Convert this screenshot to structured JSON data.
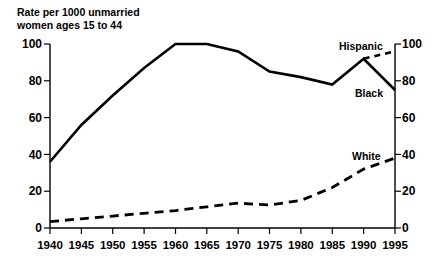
{
  "chart_data": {
    "type": "line",
    "title": "Rate per 1000 unmarried women ages 15 to 44",
    "title_lines": [
      "Rate per 1000 unmarried",
      "women ages 15 to 44"
    ],
    "xlabel": "",
    "ylabel": "",
    "x": [
      1940,
      1945,
      1950,
      1955,
      1960,
      1965,
      1970,
      1975,
      1980,
      1985,
      1990,
      1995
    ],
    "xtick_labels": [
      "1940",
      "1945",
      "1950",
      "1955",
      "1960",
      "1965",
      "1970",
      "1975",
      "1980",
      "1985",
      "1990",
      "1995"
    ],
    "xlim": [
      1940,
      1995
    ],
    "ylim": [
      0,
      100
    ],
    "yticks": [
      0,
      20,
      40,
      60,
      80,
      100
    ],
    "ytick_labels": [
      "0",
      "20",
      "40",
      "60",
      "80",
      "100"
    ],
    "ytick_labels_right": [
      "0",
      "20",
      "40",
      "60",
      "80",
      "100"
    ],
    "grid": false,
    "legend_position": "inline-annotations",
    "series": [
      {
        "name": "Black",
        "style": "solid",
        "color": "#000000",
        "x": [
          1940,
          1945,
          1950,
          1955,
          1960,
          1965,
          1970,
          1975,
          1980,
          1985,
          1990,
          1995
        ],
        "values": [
          36,
          56,
          72,
          87,
          100,
          100,
          96,
          85,
          82,
          78,
          92,
          75
        ]
      },
      {
        "name": "Hispanic",
        "style": "dashed",
        "color": "#000000",
        "x": [
          1990,
          1995
        ],
        "values": [
          92,
          96
        ]
      },
      {
        "name": "White",
        "style": "dashed",
        "color": "#000000",
        "x": [
          1940,
          1945,
          1950,
          1955,
          1960,
          1965,
          1970,
          1975,
          1980,
          1985,
          1990,
          1995
        ],
        "values": [
          3.5,
          5,
          6.5,
          8,
          9.5,
          11.5,
          13.5,
          12.5,
          15,
          22,
          32,
          38
        ]
      }
    ],
    "annotations": [
      {
        "text": "Hispanic",
        "x": 1991,
        "y": 100
      },
      {
        "text": "Black",
        "x": 1991,
        "y": 79
      },
      {
        "text": "White",
        "x": 1991,
        "y": 44
      }
    ]
  }
}
